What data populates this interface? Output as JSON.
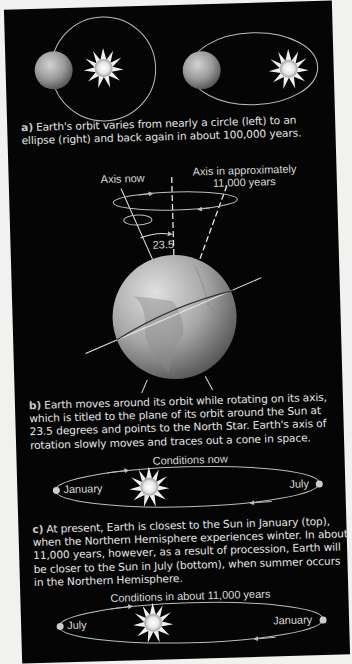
{
  "figure": {
    "panel_a": {
      "label": "a)",
      "caption": "Earth's orbit varies from nearly a circle (left) to an ellipse (right) and back again in about 100,000 years."
    },
    "panel_b": {
      "axis_now_label": "Axis now",
      "axis_future_label_line1": "Axis in approximately",
      "axis_future_label_line2": "11,000 years",
      "tilt_angle_label": "23.5",
      "label": "b)",
      "caption": "Earth moves around its orbit while rotating on its axis, which is titled to the plane of its orbit around the Sun at 23.5 degrees and points to the North Star. Earth's axis of rotation slowly moves and traces out a cone in space."
    },
    "panel_c": {
      "now_title": "Conditions now",
      "now_left_label": "January",
      "now_right_label": "July",
      "label": "c)",
      "caption": "At present, Earth is closest to the Sun in January (top), when the Northern Hemisphere experiences winter. In about 11,000 years, however, as a result of procession, Earth will be closer to the Sun in July (bottom), when summer occurs in the Northern Hemisphere.",
      "future_title": "Conditions in about 11,000 years",
      "future_left_label": "July",
      "future_right_label": "January"
    },
    "colors": {
      "background": "#050505",
      "page": "#f1f1ef",
      "text": "#e6e6e6",
      "orbit_line": "#bdbdbd"
    }
  }
}
